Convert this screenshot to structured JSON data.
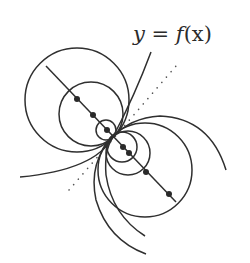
{
  "figure": {
    "label": {
      "lhs": "y",
      "eq": "=",
      "rhs_func": "f",
      "rhs_arg": "(x)"
    },
    "colors": {
      "ink": "#2f2f2f",
      "background": "#ffffff"
    }
  }
}
